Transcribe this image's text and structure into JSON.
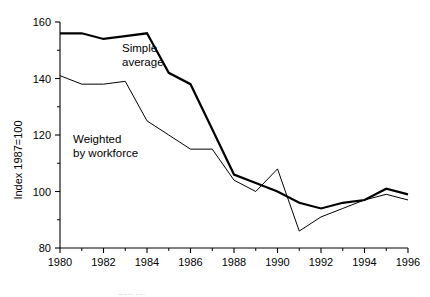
{
  "figure": {
    "ghost_top_fragment": ")) |",
    "ghost_bottom_fragment": "Source:"
  },
  "axes": {
    "y_title": "Index 1987=100",
    "y_ticks": [
      "80",
      "100",
      "120",
      "140",
      "160"
    ],
    "y_tick_values": [
      80,
      100,
      120,
      140,
      160
    ],
    "y_minor_values": [
      90,
      110,
      130,
      150
    ],
    "x_ticks": [
      "1980",
      "1982",
      "1984",
      "1986",
      "1988",
      "1990",
      "1992",
      "1994",
      "1996"
    ],
    "x_tick_values": [
      1980,
      1982,
      1984,
      1986,
      1988,
      1990,
      1992,
      1994,
      1996
    ],
    "x_minor_values": [
      1981,
      1983,
      1985,
      1987,
      1989,
      1991,
      1993,
      1995
    ]
  },
  "annotations": {
    "simple_average": {
      "line1": "Simple",
      "line2": "average"
    },
    "weighted": {
      "line1": "Weighted",
      "line2": "by workforce"
    }
  },
  "colors": {
    "line": "#000000",
    "background": "#ffffff",
    "axis": "#000000"
  },
  "chart_data": {
    "type": "line",
    "title": "",
    "subtitle": "",
    "xlabel": "",
    "ylabel": "Index 1987=100",
    "xlim": [
      1980,
      1996
    ],
    "ylim": [
      80,
      160
    ],
    "grid": false,
    "legend": "inline-annotations",
    "x": [
      1980,
      1981,
      1982,
      1983,
      1984,
      1985,
      1986,
      1987,
      1988,
      1989,
      1990,
      1991,
      1992,
      1993,
      1994,
      1995,
      1996
    ],
    "series": [
      {
        "name": "Simple average",
        "style": "thick",
        "linewidth": 2.2,
        "values": [
          156,
          156,
          154,
          155,
          156,
          142,
          138,
          122,
          106,
          103,
          100,
          96,
          94,
          96,
          97,
          101,
          99
        ]
      },
      {
        "name": "Weighted by workforce",
        "style": "thin",
        "linewidth": 1.0,
        "values": [
          141,
          138,
          138,
          139,
          125,
          120,
          115,
          115,
          104,
          100,
          108,
          86,
          91,
          94,
          97,
          99,
          97
        ]
      }
    ]
  }
}
